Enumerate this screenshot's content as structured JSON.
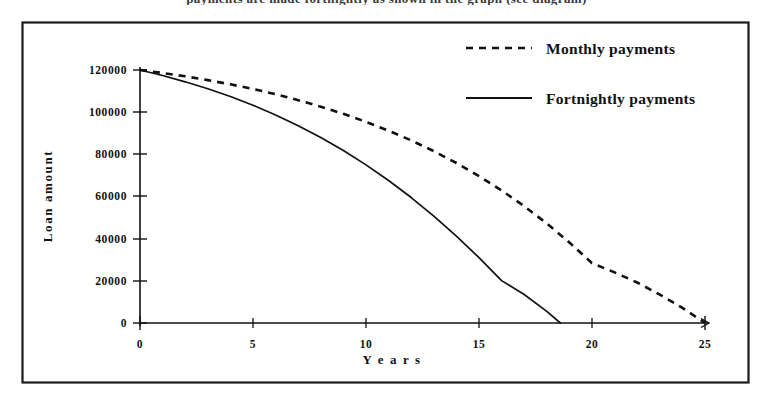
{
  "figure": {
    "border_color": "#1a1a1a",
    "background": "#ffffff",
    "clipped_caption_above": "payments are made fortnightly as shown in the graph (see diagram)"
  },
  "chart_data": {
    "type": "line",
    "title": "",
    "xlabel": "Y e a r s",
    "ylabel": "Loan amount",
    "xlim": [
      0,
      25
    ],
    "ylim": [
      0,
      120000
    ],
    "grid": false,
    "xticks": [
      "0",
      "5",
      "10",
      "15",
      "20",
      "25"
    ],
    "xtick_values": [
      0,
      5,
      10,
      15,
      20,
      25
    ],
    "yticks": [
      "0",
      "20000",
      "40000",
      "60000",
      "80000",
      "100000",
      "120000"
    ],
    "ytick_values": [
      0,
      20000,
      40000,
      60000,
      80000,
      100000,
      120000
    ],
    "legend_position": "top-right",
    "series": [
      {
        "name": "Monthly payments",
        "style": "dashed",
        "color": "#111111",
        "x": [
          0,
          1,
          2,
          3,
          4,
          5,
          6,
          7,
          8,
          9,
          10,
          11,
          12,
          13,
          14,
          15,
          16,
          17,
          18,
          19,
          20,
          21,
          22,
          23,
          24,
          25
        ],
        "values": [
          120000,
          118600,
          117000,
          115200,
          113200,
          111000,
          108500,
          105700,
          102600,
          99200,
          95400,
          91200,
          86600,
          81500,
          75900,
          69700,
          62900,
          55400,
          47200,
          38200,
          28400,
          24000,
          19200,
          13500,
          7200,
          0
        ]
      },
      {
        "name": "Fortnightly payments",
        "style": "solid",
        "color": "#111111",
        "x": [
          0,
          1,
          2,
          3,
          4,
          5,
          6,
          7,
          8,
          9,
          10,
          11,
          12,
          13,
          14,
          15,
          16,
          17,
          18,
          18.6
        ],
        "values": [
          120000,
          117400,
          114400,
          111100,
          107400,
          103300,
          98700,
          93600,
          88000,
          81800,
          75000,
          67600,
          59500,
          50700,
          41200,
          31000,
          20100,
          13500,
          5500,
          0
        ]
      }
    ]
  },
  "legend": {
    "items": [
      {
        "label": "Monthly payments",
        "style": "dashed"
      },
      {
        "label": "Fortnightly payments",
        "style": "solid"
      }
    ]
  }
}
